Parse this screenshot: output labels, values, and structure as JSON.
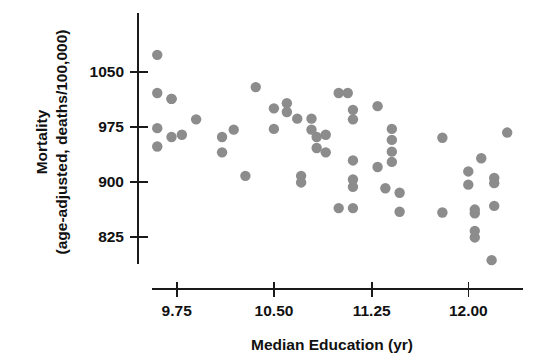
{
  "chart_data": {
    "type": "scatter",
    "title": "",
    "xlabel": "Median Education (yr)",
    "ylabel_line1": "Mortality",
    "ylabel_line2": "(age-adjusted, deaths/100,000)",
    "xticks": [
      "9.75",
      "10.50",
      "11.25",
      "12.00"
    ],
    "xtick_values": [
      9.75,
      10.5,
      11.25,
      12.0
    ],
    "yticks": [
      "1050",
      "975",
      "900",
      "825"
    ],
    "ytick_values": [
      1050,
      975,
      900,
      825
    ],
    "xlim": [
      9.55,
      12.42
    ],
    "ylim": [
      785,
      1085
    ],
    "grid": false,
    "legend": null,
    "marker": {
      "shape": "circle",
      "color": "#8c8c8c",
      "radius_px": 5.2
    },
    "points": [
      {
        "x": 9.71,
        "y": 1013
      },
      {
        "x": 9.6,
        "y": 1073
      },
      {
        "x": 9.71,
        "y": 1013
      },
      {
        "x": 9.6,
        "y": 1021
      },
      {
        "x": 9.6,
        "y": 973
      },
      {
        "x": 9.9,
        "y": 985
      },
      {
        "x": 9.79,
        "y": 964
      },
      {
        "x": 9.71,
        "y": 961
      },
      {
        "x": 9.6,
        "y": 948
      },
      {
        "x": 10.1,
        "y": 961
      },
      {
        "x": 10.19,
        "y": 971
      },
      {
        "x": 10.1,
        "y": 940
      },
      {
        "x": 10.28,
        "y": 908
      },
      {
        "x": 10.36,
        "y": 1029
      },
      {
        "x": 10.5,
        "y": 1000
      },
      {
        "x": 10.5,
        "y": 972
      },
      {
        "x": 10.6,
        "y": 1007
      },
      {
        "x": 10.6,
        "y": 995
      },
      {
        "x": 10.68,
        "y": 986
      },
      {
        "x": 10.71,
        "y": 899
      },
      {
        "x": 10.71,
        "y": 908
      },
      {
        "x": 10.79,
        "y": 986
      },
      {
        "x": 10.79,
        "y": 971
      },
      {
        "x": 10.83,
        "y": 961
      },
      {
        "x": 10.83,
        "y": 946
      },
      {
        "x": 10.9,
        "y": 964
      },
      {
        "x": 10.9,
        "y": 940
      },
      {
        "x": 11.0,
        "y": 1021
      },
      {
        "x": 11.07,
        "y": 1021
      },
      {
        "x": 11.0,
        "y": 864
      },
      {
        "x": 11.11,
        "y": 998
      },
      {
        "x": 11.11,
        "y": 985
      },
      {
        "x": 11.11,
        "y": 929
      },
      {
        "x": 11.11,
        "y": 903
      },
      {
        "x": 11.11,
        "y": 893
      },
      {
        "x": 11.11,
        "y": 864
      },
      {
        "x": 11.3,
        "y": 1003
      },
      {
        "x": 11.3,
        "y": 920
      },
      {
        "x": 11.41,
        "y": 972
      },
      {
        "x": 11.41,
        "y": 957
      },
      {
        "x": 11.41,
        "y": 941
      },
      {
        "x": 11.41,
        "y": 927
      },
      {
        "x": 11.36,
        "y": 891
      },
      {
        "x": 11.47,
        "y": 885
      },
      {
        "x": 11.47,
        "y": 859
      },
      {
        "x": 11.8,
        "y": 960
      },
      {
        "x": 11.8,
        "y": 858
      },
      {
        "x": 12.0,
        "y": 914
      },
      {
        "x": 12.0,
        "y": 896
      },
      {
        "x": 12.05,
        "y": 862
      },
      {
        "x": 12.05,
        "y": 857
      },
      {
        "x": 12.05,
        "y": 833
      },
      {
        "x": 12.05,
        "y": 824
      },
      {
        "x": 12.1,
        "y": 932
      },
      {
        "x": 12.2,
        "y": 905
      },
      {
        "x": 12.2,
        "y": 898
      },
      {
        "x": 12.2,
        "y": 867
      },
      {
        "x": 12.3,
        "y": 967
      },
      {
        "x": 12.18,
        "y": 793
      }
    ]
  }
}
